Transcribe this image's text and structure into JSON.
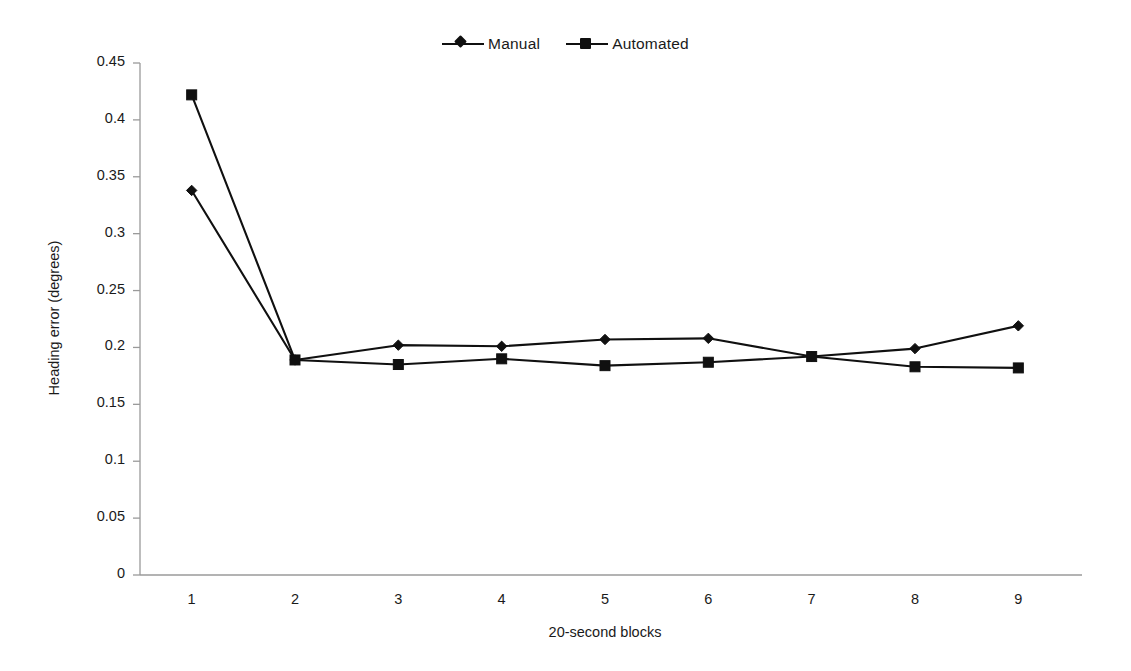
{
  "chart_data": {
    "type": "line",
    "title": "",
    "xlabel": "20-second blocks",
    "ylabel": "Heading error (degrees)",
    "categories": [
      "1",
      "2",
      "3",
      "4",
      "5",
      "6",
      "7",
      "8",
      "9"
    ],
    "x": [
      1,
      2,
      3,
      4,
      5,
      6,
      7,
      8,
      9
    ],
    "ylim": [
      0,
      0.45
    ],
    "ytick_labels": [
      "0",
      "0.05",
      "0.1",
      "0.15",
      "0.2",
      "0.25",
      "0.3",
      "0.35",
      "0.4",
      "0.45"
    ],
    "ytick_values": [
      0,
      0.05,
      0.1,
      0.15,
      0.2,
      0.25,
      0.3,
      0.35,
      0.4,
      0.45
    ],
    "grid": false,
    "legend_position": "top-center",
    "series": [
      {
        "name": "Manual",
        "marker": "diamond",
        "color": "#101010",
        "values": [
          0.338,
          0.189,
          0.202,
          0.201,
          0.207,
          0.208,
          0.192,
          0.199,
          0.219
        ]
      },
      {
        "name": "Automated",
        "marker": "square",
        "color": "#101010",
        "values": [
          0.422,
          0.189,
          0.185,
          0.19,
          0.184,
          0.187,
          0.192,
          0.183,
          0.182
        ]
      }
    ]
  },
  "legend": {
    "items": [
      {
        "label": "Manual",
        "marker": "diamond"
      },
      {
        "label": "Automated",
        "marker": "square"
      }
    ]
  },
  "axes": {
    "y_title": "Heading error (degrees)",
    "x_title": "20-second blocks"
  }
}
